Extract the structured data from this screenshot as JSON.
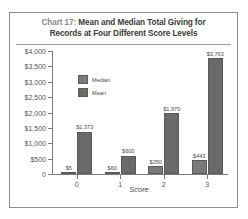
{
  "figure": {
    "title_prefix": "Chart 17:",
    "title_line1": "Mean and Median Total Giving for",
    "title_line2": "Records at Four Different Score Levels"
  },
  "legend": {
    "position": "inside-upper-left",
    "entries": [
      {
        "label": "Median",
        "color": "#7a7a7a"
      },
      {
        "label": "Mean",
        "color": "#6a6a6a"
      }
    ]
  },
  "chart_data": {
    "type": "bar",
    "title": "Chart 17: Mean and Median Total Giving for Records at Four Different Score Levels",
    "xlabel": "Score",
    "ylabel": "",
    "categories": [
      "0",
      "1",
      "2",
      "3"
    ],
    "series": [
      {
        "name": "Median",
        "color": "#7a7a7a",
        "values": [
          5,
          60,
          250,
          443
        ],
        "labels": [
          "$5",
          "$60",
          "$250",
          "$443"
        ]
      },
      {
        "name": "Mean",
        "color": "#6a6a6a",
        "values": [
          1373,
          600,
          1970,
          3763
        ],
        "labels": [
          "$1,373",
          "$600",
          "$1,970",
          "$3,763"
        ]
      }
    ],
    "ylim": [
      0,
      4000
    ],
    "ytick_values": [
      0,
      500,
      1000,
      1500,
      2000,
      2500,
      3000,
      3500,
      4000
    ],
    "ytick_labels": [
      "0",
      "$500",
      "$1,000",
      "$1,500",
      "$2,000",
      "$2,500",
      "$3,000",
      "$3,500",
      "$4,000"
    ],
    "grid": false,
    "legend_position": "inside-upper-left"
  }
}
